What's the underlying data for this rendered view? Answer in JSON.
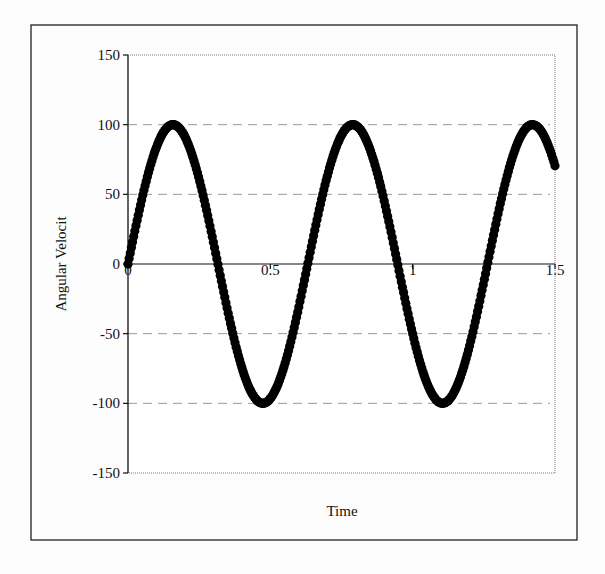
{
  "chart_data": {
    "type": "scatter",
    "title": "",
    "xlabel": "Time",
    "ylabel": "Angular Velocit",
    "xlim": [
      0,
      1.5
    ],
    "ylim": [
      -150,
      150
    ],
    "x_ticks": [
      "0",
      "0.5",
      "1",
      "1.5"
    ],
    "y_ticks": [
      "150",
      "100",
      "50",
      "0",
      "-50",
      "-100",
      "-150"
    ],
    "grid": {
      "horizontal": true,
      "style": "dashed",
      "color": "#999999"
    },
    "legend": null,
    "marker_color": "#000000",
    "series": [
      {
        "name": "Angular Velocity",
        "description": "approximately 100*sin(10*t), sampled densely from t=0 to t=1.5",
        "x": [
          0,
          0.05,
          0.1,
          0.157,
          0.2,
          0.25,
          0.3,
          0.314,
          0.35,
          0.4,
          0.471,
          0.5,
          0.55,
          0.6,
          0.628,
          0.7,
          0.75,
          0.785,
          0.85,
          0.9,
          0.942,
          1.0,
          1.05,
          1.1,
          1.1,
          1.15,
          1.2,
          1.257,
          1.3,
          1.35,
          1.414,
          1.45,
          1.5
        ],
        "y": [
          0,
          48,
          84,
          100,
          91,
          60,
          14,
          0,
          -35,
          -76,
          -100,
          -96,
          -71,
          -28,
          0,
          66,
          94,
          100,
          80,
          41,
          0,
          -54,
          -88,
          -100,
          -100,
          -87,
          -54,
          0,
          42,
          81,
          100,
          94,
          72
        ]
      }
    ]
  }
}
